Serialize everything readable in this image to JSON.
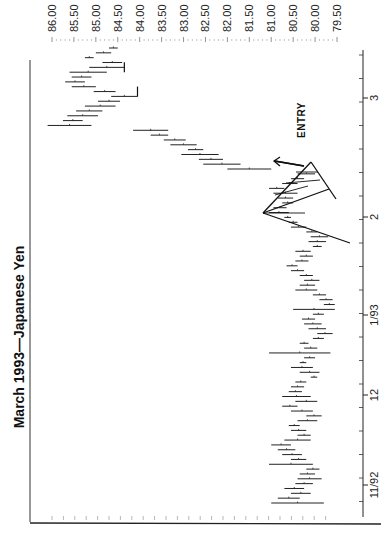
{
  "chart_data": {
    "type": "ohlc_bar",
    "title": "March 1993—Japanese Yen",
    "orientation_note": "rotated 90 degrees clockwise; price axis along top, time axis along right",
    "xlabel": "",
    "ylabel": "",
    "price_axis": {
      "ticks": [
        "86.00",
        "85.50",
        "85.00",
        "84.50",
        "84.00",
        "83.50",
        "83.00",
        "82.50",
        "82.00",
        "81.50",
        "81.00",
        "80.50",
        "80.00",
        "79.50"
      ],
      "range": [
        79.35,
        86.15
      ]
    },
    "date_axis": {
      "ticks": [
        "11/92",
        "12",
        "1/93",
        "2",
        "3"
      ]
    },
    "annotations": [
      {
        "text": "ENTRY",
        "type": "label"
      },
      {
        "type": "pattern_lines",
        "description": "triangle / flag pattern drawn near the 2 month mark with arrow pointing up toward the breakout"
      }
    ],
    "bars": [
      {
        "t": 0,
        "high": 81.0,
        "low": 79.8
      },
      {
        "t": 1,
        "high": 80.85,
        "low": 80.35
      },
      {
        "t": 2,
        "high": 80.55,
        "low": 80.1
      },
      {
        "t": 3,
        "high": 80.7,
        "low": 80.25
      },
      {
        "t": 4,
        "high": 80.45,
        "low": 80.05
      },
      {
        "t": 5,
        "high": 80.4,
        "low": 79.85
      },
      {
        "t": 6,
        "high": 80.35,
        "low": 80.0
      },
      {
        "t": 7,
        "high": 80.2,
        "low": 79.9
      },
      {
        "t": 8,
        "high": 81.05,
        "low": 80.05
      },
      {
        "t": 9,
        "high": 80.55,
        "low": 80.2
      },
      {
        "t": 10,
        "high": 80.75,
        "low": 80.3
      },
      {
        "t": 11,
        "high": 80.85,
        "low": 80.45
      },
      {
        "t": 12,
        "high": 81.0,
        "low": 80.55
      },
      {
        "t": 13,
        "high": 80.7,
        "low": 80.1
      },
      {
        "t": 14,
        "high": 80.4,
        "low": 80.1
      },
      {
        "t": 15,
        "high": 80.55,
        "low": 80.2
      },
      {
        "t": 16,
        "high": 80.6,
        "low": 80.35
      },
      {
        "t": 17,
        "high": 80.4,
        "low": 79.95
      },
      {
        "t": 18,
        "high": 80.2,
        "low": 79.85
      },
      {
        "t": 19,
        "high": 80.55,
        "low": 80.05
      },
      {
        "t": 20,
        "high": 80.75,
        "low": 80.4
      },
      {
        "t": 21,
        "high": 80.45,
        "low": 79.95
      },
      {
        "t": 22,
        "high": 80.75,
        "low": 80.1
      },
      {
        "t": 23,
        "high": 80.6,
        "low": 80.3
      },
      {
        "t": 24,
        "high": 80.55,
        "low": 80.25
      },
      {
        "t": 25,
        "high": 80.45,
        "low": 80.2
      },
      {
        "t": 26,
        "high": 80.1,
        "low": 79.95
      },
      {
        "t": 27,
        "high": 80.35,
        "low": 79.9
      },
      {
        "t": 28,
        "high": 80.55,
        "low": 80.05
      },
      {
        "t": 29,
        "high": 80.35,
        "low": 80.2
      },
      {
        "t": 30,
        "high": 80.25,
        "low": 80.0
      },
      {
        "t": 31,
        "high": 81.05,
        "low": 79.65
      },
      {
        "t": 32,
        "high": 80.25,
        "low": 79.95
      },
      {
        "t": 33,
        "high": 80.35,
        "low": 80.15
      },
      {
        "t": 34,
        "high": 80.05,
        "low": 79.8
      },
      {
        "t": 35,
        "high": 79.95,
        "low": 79.6
      },
      {
        "t": 36,
        "high": 80.15,
        "low": 79.75
      },
      {
        "t": 37,
        "high": 80.25,
        "low": 79.85
      },
      {
        "t": 38,
        "high": 80.3,
        "low": 80.0
      },
      {
        "t": 39,
        "high": 80.05,
        "low": 79.8
      },
      {
        "t": 40,
        "high": 80.5,
        "low": 79.55
      },
      {
        "t": 41,
        "high": 79.8,
        "low": 79.55
      },
      {
        "t": 42,
        "high": 79.9,
        "low": 79.6
      },
      {
        "t": 43,
        "high": 80.05,
        "low": 79.75
      },
      {
        "t": 44,
        "high": 80.45,
        "low": 79.95
      },
      {
        "t": 45,
        "high": 80.35,
        "low": 80.0
      },
      {
        "t": 46,
        "high": 80.25,
        "low": 79.9
      },
      {
        "t": 47,
        "high": 80.35,
        "low": 80.05
      },
      {
        "t": 48,
        "high": 80.55,
        "low": 80.25
      },
      {
        "t": 49,
        "high": 80.65,
        "low": 80.4
      },
      {
        "t": 50,
        "high": 80.45,
        "low": 80.15
      },
      {
        "t": 51,
        "high": 80.35,
        "low": 80.05
      },
      {
        "t": 52,
        "high": 80.45,
        "low": 80.1
      },
      {
        "t": 53,
        "high": 80.05,
        "low": 79.85
      },
      {
        "t": 54,
        "high": 80.15,
        "low": 79.75
      },
      {
        "t": 55,
        "high": 80.1,
        "low": 79.7
      },
      {
        "t": 56,
        "high": 80.2,
        "low": 79.95
      },
      {
        "t": 57,
        "high": 80.55,
        "low": 80.2
      },
      {
        "t": 58,
        "high": 80.6,
        "low": 80.4
      },
      {
        "t": 59,
        "high": 80.7,
        "low": 80.55
      },
      {
        "t": 60,
        "high": 81.05,
        "low": 80.6
      },
      {
        "t": 61,
        "high": 80.95,
        "low": 80.65
      },
      {
        "t": 62,
        "high": 80.75,
        "low": 80.5
      },
      {
        "t": 63,
        "high": 80.85,
        "low": 80.5
      },
      {
        "t": 64,
        "high": 80.95,
        "low": 80.4
      },
      {
        "t": 65,
        "high": 81.05,
        "low": 80.7
      },
      {
        "t": 66,
        "high": 80.75,
        "low": 80.4
      },
      {
        "t": 67,
        "high": 80.55,
        "low": 80.25
      },
      {
        "t": 68,
        "high": 80.4,
        "low": 80.0
      },
      {
        "t": 69,
        "high": 82.0,
        "low": 81.0
      },
      {
        "t": 70,
        "high": 82.55,
        "low": 81.7
      },
      {
        "t": 71,
        "high": 82.65,
        "low": 82.1
      },
      {
        "t": 72,
        "high": 83.05,
        "low": 82.2
      },
      {
        "t": 73,
        "high": 82.9,
        "low": 82.55
      },
      {
        "t": 74,
        "high": 83.3,
        "low": 82.7
      },
      {
        "t": 75,
        "high": 83.45,
        "low": 82.95
      },
      {
        "t": 76,
        "high": 83.75,
        "low": 83.35
      },
      {
        "t": 77,
        "high": 84.15,
        "low": 83.35
      },
      {
        "t": 78,
        "high": 86.1,
        "low": 85.1
      },
      {
        "t": 79,
        "high": 85.75,
        "low": 85.3
      },
      {
        "t": 80,
        "high": 85.65,
        "low": 84.95
      },
      {
        "t": 81,
        "high": 85.45,
        "low": 84.85
      },
      {
        "t": 82,
        "high": 85.25,
        "low": 84.55
      },
      {
        "t": 83,
        "high": 84.95,
        "low": 84.45
      },
      {
        "t": 84,
        "high": 84.65,
        "low": 84.05
      },
      {
        "t": 85,
        "high": 85.05,
        "low": 84.55
      },
      {
        "t": 86,
        "high": 85.55,
        "low": 85.0
      },
      {
        "t": 87,
        "high": 85.7,
        "low": 85.25
      },
      {
        "t": 88,
        "high": 85.55,
        "low": 85.1
      },
      {
        "t": 89,
        "high": 85.6,
        "low": 84.75
      },
      {
        "t": 90,
        "high": 85.15,
        "low": 84.35
      },
      {
        "t": 91,
        "high": 84.85,
        "low": 84.4
      },
      {
        "t": 92,
        "high": 85.25,
        "low": 85.05
      },
      {
        "t": 93,
        "high": 85.0,
        "low": 84.65
      },
      {
        "t": 94,
        "high": 84.7,
        "low": 84.5
      }
    ]
  }
}
